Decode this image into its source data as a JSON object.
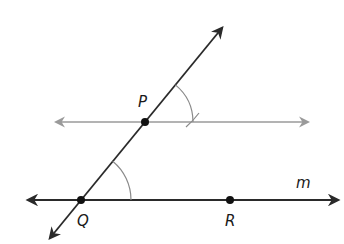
{
  "diagram": {
    "type": "geometry-construction",
    "colors": {
      "primary_line": "#2a2a2a",
      "construction_line": "#999999",
      "arc": "#8a8a8a",
      "point": "#111111"
    },
    "points": [
      {
        "id": "P",
        "label": "P",
        "x": 145,
        "y": 122
      },
      {
        "id": "Q",
        "label": "Q",
        "x": 81,
        "y": 200
      },
      {
        "id": "R",
        "label": "R",
        "x": 230,
        "y": 200
      }
    ],
    "lines": [
      {
        "id": "m",
        "label": "m",
        "through": [
          "Q",
          "R"
        ]
      },
      {
        "id": "transversal",
        "through": [
          "Q",
          "P"
        ]
      },
      {
        "id": "parallel",
        "through": [
          "P"
        ],
        "style": "gray"
      }
    ],
    "labels": {
      "P": "P",
      "Q": "Q",
      "R": "R",
      "m": "m"
    },
    "arcs": [
      {
        "center": "Q",
        "radius": 50
      },
      {
        "center": "P",
        "radius": 48
      }
    ]
  }
}
